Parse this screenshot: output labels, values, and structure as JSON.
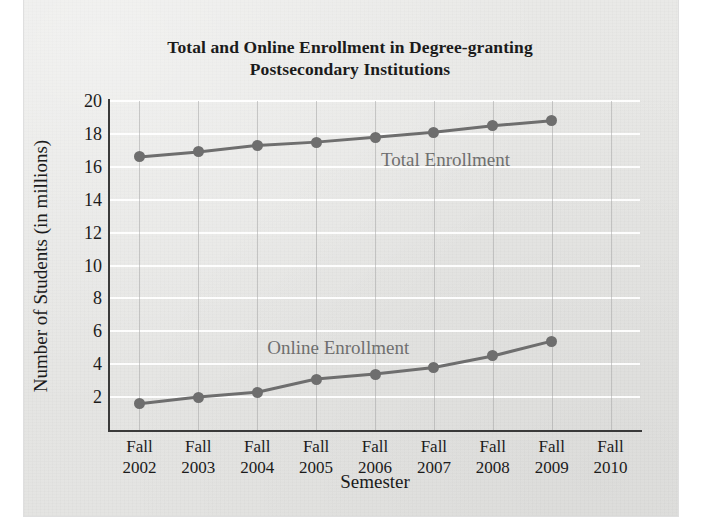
{
  "chart_data": {
    "type": "line",
    "title": "Total and Online Enrollment in Degree-granting Postsecondary Institutions",
    "title_line1": "Total and Online Enrollment in Degree-granting",
    "title_line2": "Postsecondary Institutions",
    "xlabel": "Semester",
    "ylabel": "Number of Students (in millions)",
    "categories": [
      "Fall 2002",
      "Fall 2003",
      "Fall 2004",
      "Fall 2005",
      "Fall 2006",
      "Fall 2007",
      "Fall 2008",
      "Fall 2009",
      "Fall 2010"
    ],
    "category_lines": [
      {
        "top": "Fall",
        "bottom": "2002"
      },
      {
        "top": "Fall",
        "bottom": "2003"
      },
      {
        "top": "Fall",
        "bottom": "2004"
      },
      {
        "top": "Fall",
        "bottom": "2005"
      },
      {
        "top": "Fall",
        "bottom": "2006"
      },
      {
        "top": "Fall",
        "bottom": "2007"
      },
      {
        "top": "Fall",
        "bottom": "2008"
      },
      {
        "top": "Fall",
        "bottom": "2009"
      },
      {
        "top": "Fall",
        "bottom": "2010"
      }
    ],
    "yticks": [
      20,
      18,
      16,
      14,
      12,
      10,
      8,
      6,
      4,
      2
    ],
    "ylim": [
      0,
      20
    ],
    "grid": "horizontal-white-and-vertical-gray",
    "legend": "inline-labels",
    "series": [
      {
        "name": "Total Enrollment",
        "color": "#6e6e6e",
        "values": [
          16.6,
          16.9,
          17.3,
          17.5,
          17.8,
          18.1,
          18.5,
          18.8,
          null
        ]
      },
      {
        "name": "Online Enrollment",
        "color": "#6e6e6e",
        "values": [
          1.6,
          2.0,
          2.3,
          3.1,
          3.4,
          3.8,
          4.5,
          5.4,
          null
        ]
      }
    ],
    "annotations": [
      {
        "text": "Total Enrollment",
        "series": "Total Enrollment"
      },
      {
        "text": "Online Enrollment",
        "series": "Online Enrollment"
      }
    ]
  }
}
